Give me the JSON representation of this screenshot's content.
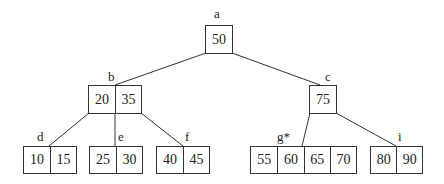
{
  "diagram": {
    "type": "B-tree",
    "nodes": {
      "a": {
        "label": "a",
        "keys": [
          "50"
        ]
      },
      "b": {
        "label": "b",
        "keys": [
          "20",
          "35"
        ]
      },
      "c": {
        "label": "c",
        "keys": [
          "75"
        ]
      },
      "d": {
        "label": "d",
        "keys": [
          "10",
          "15"
        ]
      },
      "e": {
        "label": "e",
        "keys": [
          "25",
          "30"
        ]
      },
      "f": {
        "label": "f",
        "keys": [
          "40",
          "45"
        ]
      },
      "g": {
        "label": "g*",
        "keys": [
          "55",
          "60",
          "65",
          "70"
        ]
      },
      "i": {
        "label": "i",
        "keys": [
          "80",
          "90"
        ]
      }
    },
    "edges": [
      [
        "a",
        "b"
      ],
      [
        "a",
        "c"
      ],
      [
        "b",
        "d"
      ],
      [
        "b",
        "e"
      ],
      [
        "b",
        "f"
      ],
      [
        "c",
        "g"
      ],
      [
        "c",
        "i"
      ]
    ]
  }
}
